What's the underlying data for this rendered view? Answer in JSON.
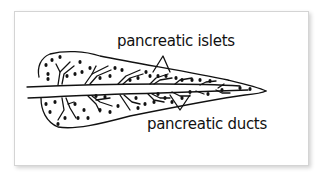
{
  "diagram": {
    "style": "hand-drawn line art",
    "colors": {
      "background": "#ffffff",
      "ink": "#111111",
      "card_border": "#d4d4d4"
    },
    "labels": [
      {
        "id": "islets",
        "text": "pancreatic islets"
      },
      {
        "id": "ducts",
        "text": "pancreatic ducts"
      }
    ]
  }
}
